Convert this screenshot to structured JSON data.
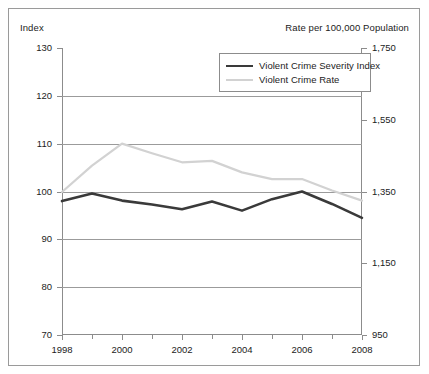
{
  "figure": {
    "left_axis_caption": "Index",
    "right_axis_caption": "Rate per 100,000 Population"
  },
  "legend": {
    "items": [
      {
        "label": "Violent Crime Severity Index",
        "color": "#3a3a3a",
        "width": 2.6
      },
      {
        "label": "Violent Crime Rate",
        "color": "#d2d2d2",
        "width": 2.2
      }
    ]
  },
  "chart_data": {
    "type": "line",
    "title": "",
    "xlabel": "",
    "ylabel": "Index",
    "ylabel_right": "Rate per 100,000 Population",
    "grid": true,
    "legend_position": "top-right",
    "x": [
      1998,
      1999,
      2000,
      2001,
      2002,
      2003,
      2004,
      2005,
      2006,
      2007,
      2008
    ],
    "xlim": [
      1998,
      2008
    ],
    "xticks": [
      1998,
      2000,
      2002,
      2004,
      2006,
      2008
    ],
    "xticklabels": [
      "1998",
      "2000",
      "2002",
      "2004",
      "2006",
      "2008"
    ],
    "xminorticks": [
      1999,
      2001,
      2003,
      2005,
      2007
    ],
    "ylim": [
      70,
      130
    ],
    "yticks": [
      70,
      80,
      90,
      100,
      110,
      120,
      130
    ],
    "yticklabels": [
      "70",
      "80",
      "90",
      "100",
      "110",
      "120",
      "130"
    ],
    "ylim_right": [
      950,
      1750
    ],
    "yticks_right": [
      950,
      1150,
      1350,
      1550,
      1750
    ],
    "yticklabels_right": [
      "950",
      "1,150",
      "1,350",
      "1,550",
      "1,750"
    ],
    "series": [
      {
        "name": "Violent Crime Severity Index",
        "axis": "left",
        "color": "#3a3a3a",
        "values": [
          98.0,
          99.6,
          98.1,
          97.3,
          96.3,
          97.9,
          96.0,
          98.4,
          100.0,
          97.4,
          94.5
        ]
      },
      {
        "name": "Violent Crime Rate",
        "axis": "left",
        "color": "#d2d2d2",
        "values": [
          99.9,
          105.4,
          110.0,
          108.0,
          106.1,
          106.4,
          104.0,
          102.6,
          102.6,
          100.2,
          98.1
        ]
      }
    ]
  }
}
